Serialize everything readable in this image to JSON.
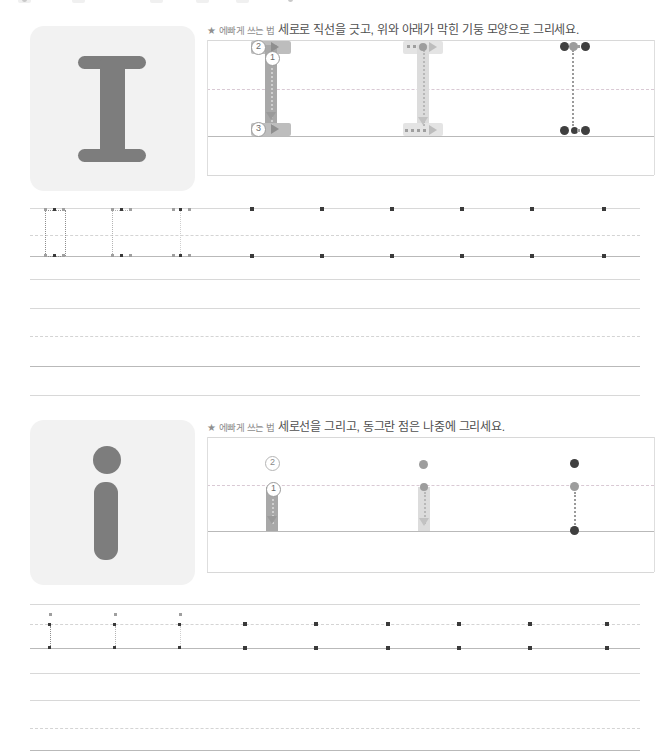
{
  "worksheet": {
    "title": "Letter I / i handwriting practice worksheet",
    "language": "ko"
  },
  "sections": [
    {
      "id": "uppercase-i",
      "letter": "I",
      "letter_case": "uppercase",
      "tile_letter": "I",
      "instruction": {
        "star": "★",
        "label": "에빠게 쓰는 법",
        "text": "세로로 직선을 긋고, 위와 아래가 막힌 기둥 모양으로 그리세요."
      },
      "demo_panels": [
        {
          "id": "panel-1-numbered",
          "style": "solid-with-stroke-numbers",
          "stroke_numbers": [
            "2",
            "1",
            "3"
          ],
          "arrows": [
            "right",
            "down",
            "right"
          ]
        },
        {
          "id": "panel-2-dotted",
          "style": "faded-with-dotted-trace",
          "stroke_numbers": [],
          "arrows": [
            "right",
            "down",
            "right"
          ]
        },
        {
          "id": "panel-3-dots",
          "style": "guide-dots-only",
          "stroke_numbers": [],
          "arrows": []
        }
      ],
      "practice_row": {
        "trace_letters": 3,
        "dot_only_letters": 6
      },
      "blank_lines": 2
    },
    {
      "id": "lowercase-i",
      "letter": "i",
      "letter_case": "lowercase",
      "tile_letter": "i",
      "instruction": {
        "star": "★",
        "label": "에빠게 쓰는 법",
        "text": "세로선을 그리고, 동그란 점은 나중에 그리세요."
      },
      "demo_panels": [
        {
          "id": "panel-1-numbered",
          "style": "solid-with-stroke-numbers",
          "stroke_numbers": [
            "2",
            "1"
          ],
          "arrows": [
            "down"
          ]
        },
        {
          "id": "panel-2-dotted",
          "style": "faded-with-dotted-trace",
          "stroke_numbers": [],
          "arrows": [
            "down"
          ]
        },
        {
          "id": "panel-3-dots",
          "style": "guide-dots-only",
          "stroke_numbers": [],
          "arrows": []
        }
      ],
      "practice_row": {
        "trace_letters": 3,
        "dot_only_letters": 6
      },
      "blank_lines": 2
    }
  ],
  "colors": {
    "tile_background": "#f2f2f2",
    "glyph": "#7d7d7d",
    "stroke_demo": "#b0b0b0",
    "rule_line": "#b9b9b9",
    "midline_dashed": "#d9c9d4",
    "guide_dot": "#3f3f3f",
    "text": "#4f4f4f"
  }
}
